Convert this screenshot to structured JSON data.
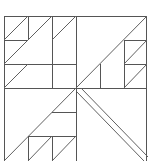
{
  "diagram": {
    "type": "quilt-block-pattern",
    "stroke_color": "#555555",
    "background": "#ffffff",
    "frame": {
      "x": 4,
      "y": 16,
      "w": 143,
      "h": 146
    },
    "center": {
      "x": 76,
      "y": 88
    },
    "quadrants": [
      "top-left",
      "top-right",
      "bottom-left",
      "bottom-right"
    ]
  }
}
